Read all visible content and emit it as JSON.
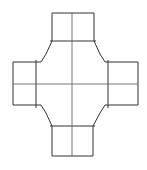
{
  "diagram": {
    "title": "",
    "type": "cross-shaped outline (four-way junction)",
    "stroke_color": "#333333",
    "guide_color": "#555555",
    "background": "#ffffff",
    "arms": [
      "top",
      "right",
      "bottom",
      "left"
    ]
  }
}
